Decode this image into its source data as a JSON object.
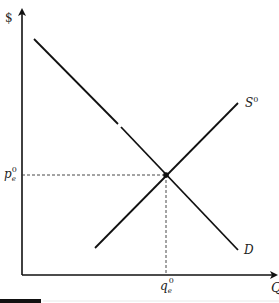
{
  "diagram": {
    "type": "supply-demand",
    "axes": {
      "y_label": "$",
      "x_label": "Q"
    },
    "curves": {
      "supply": {
        "label": "S",
        "superscript": "0"
      },
      "demand": {
        "label": "D"
      }
    },
    "equilibrium": {
      "price_label": "p",
      "price_subscript": "e",
      "price_superscript": "0",
      "quantity_label": "q",
      "quantity_subscript": "e",
      "quantity_superscript": "0"
    },
    "colors": {
      "line": "#111111",
      "dashed": "#333333",
      "background": "#ffffff"
    }
  }
}
